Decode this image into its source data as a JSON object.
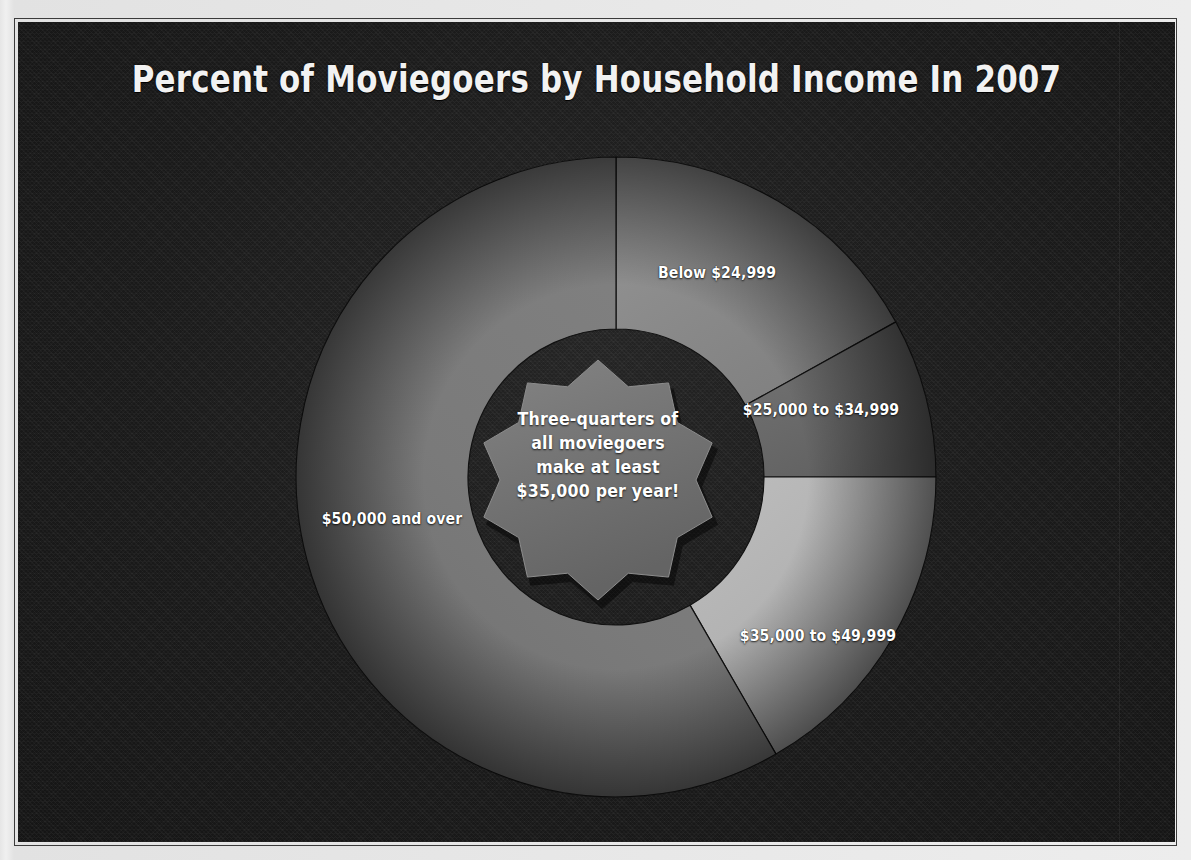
{
  "title": "Percent of Moviegoers by Household Income In 2007",
  "callout": {
    "line1": "Three-quarters of",
    "line2": "all moviegoers",
    "line3": "make at least",
    "line4": "$35,000 per year!"
  },
  "palette": {
    "background": "#1c1c1c",
    "page_margin": "#e9e9e9",
    "border": "#3b3b3b",
    "label_text": "#ffffff",
    "title_text": "#f2f2f2",
    "slice_below_24999": "#8a8a8a",
    "slice_25000_34999": "#6a6a6a",
    "slice_35000_49999": "#b0b0b0",
    "slice_50000_over": "#787878",
    "starburst": "#747474"
  },
  "chart_data": {
    "type": "pie",
    "variant": "donut",
    "title": "Percent of Moviegoers by Household Income In 2007",
    "xlabel": "",
    "ylabel": "",
    "legend": "none (slices labelled directly)",
    "units": "percent of moviegoers",
    "grid": false,
    "start_angle_deg": 0,
    "direction": "clockwise",
    "center_px": [
      598,
      455
    ],
    "outer_radius_px": 320,
    "inner_radius_px": 148,
    "categories": [
      "Below $24,999",
      "$25,000 to $34,999",
      "$35,000 to $49,999",
      "$50,000 and over"
    ],
    "values": [
      17,
      8,
      17,
      58
    ],
    "slices": [
      {
        "label": "Below $24,999",
        "value": 17,
        "start_angle_deg": 0,
        "end_angle_deg": 61,
        "color": "#8a8a8a",
        "label_x": 699,
        "label_y": 250
      },
      {
        "label": "$25,000 to $34,999",
        "value": 8,
        "start_angle_deg": 61,
        "end_angle_deg": 90,
        "color": "#6a6a6a",
        "label_x": 803,
        "label_y": 387
      },
      {
        "label": "$35,000 to $49,999",
        "value": 17,
        "start_angle_deg": 90,
        "end_angle_deg": 150,
        "color": "#b0b0b0",
        "label_x": 800,
        "label_y": 613
      },
      {
        "label": "$50,000 and over",
        "value": 58,
        "start_angle_deg": 150,
        "end_angle_deg": 360,
        "color": "#787878",
        "label_x": 374,
        "label_y": 496
      }
    ],
    "annotation": "Three-quarters of all moviegoers make at least $35,000 per year!"
  }
}
